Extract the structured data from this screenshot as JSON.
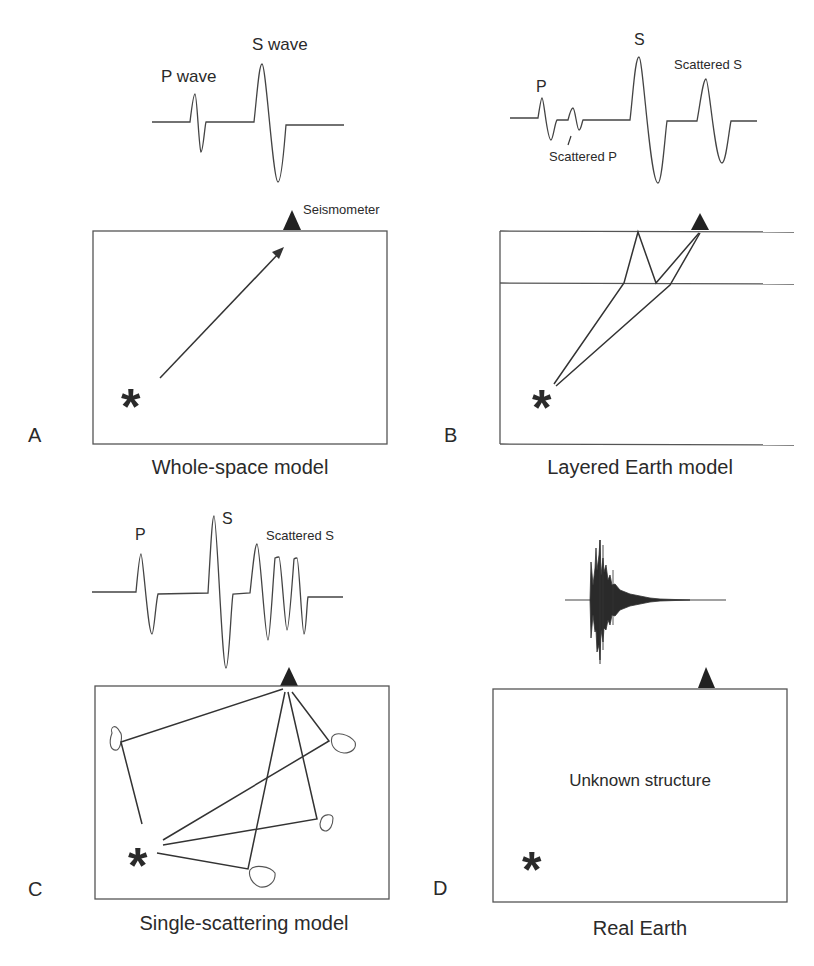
{
  "figure": {
    "panels": [
      {
        "letter": "A",
        "caption": "Whole-space model",
        "wave_labels": [
          "P wave",
          "S wave"
        ],
        "instrument_label": "Seismometer"
      },
      {
        "letter": "B",
        "caption": "Layered Earth model",
        "wave_labels": [
          "P",
          "Scattered P",
          "S",
          "Scattered S"
        ]
      },
      {
        "letter": "C",
        "caption": "Single-scattering model",
        "wave_labels": [
          "P",
          "S",
          "Scattered S"
        ]
      },
      {
        "letter": "D",
        "caption": "Real Earth",
        "inner_label": "Unknown structure"
      }
    ],
    "colors": {
      "ink": "#2a2a2a",
      "frame": "#555555",
      "background": "#ffffff"
    },
    "symbols": {
      "source": "*",
      "seismometer": "triangle"
    }
  }
}
